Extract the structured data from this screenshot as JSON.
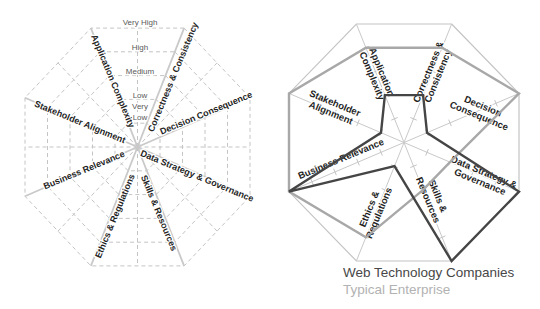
{
  "colors": {
    "series_dark": "#454545",
    "series_gray": "#a8a8a8",
    "grid_line": "#c4c4c4",
    "spoke_line": "#c9c9c9",
    "axis_label_color": "#1f1f1f",
    "scale_label_color": "#595959"
  },
  "legend": {
    "position": "bottom-right"
  },
  "chart_data": [
    {
      "type": "radar",
      "role": "scale-reference-octagon",
      "title": "",
      "axes": [
        "Application Complexity",
        "Correctness & Consistency",
        "Decision Consequence",
        "Data Strategy & Governance",
        "Skills & Resources",
        "Ethics & Regulations",
        "Business Relevance",
        "Stakeholder Alignment"
      ],
      "scale_labels": [
        "Very Low",
        "Low",
        "Medium",
        "High",
        "Very High"
      ],
      "levels": 5,
      "ylim": [
        0,
        5
      ],
      "grid": "dashed-octagon-rings",
      "series": []
    },
    {
      "type": "radar",
      "role": "comparison-octagon",
      "title": "",
      "axes": [
        [
          "Application",
          "Complexity"
        ],
        [
          "Correctness &",
          "Consistency"
        ],
        [
          "Decision",
          "Consequence"
        ],
        [
          "Data Strategy &",
          "Governance"
        ],
        [
          "Skills &",
          "Resources"
        ],
        [
          "Ethics &",
          "Regulations"
        ],
        [
          "Business Relevance"
        ],
        [
          "Stakeholder",
          "Alignment"
        ]
      ],
      "levels": 5,
      "ylim": [
        0,
        5
      ],
      "grid": "spokes-with-ticks",
      "legend_position": "bottom",
      "series": [
        {
          "name": "Typical Enterprise",
          "color": "#a8a8a8",
          "values": [
            4,
            4,
            5,
            2,
            2,
            4,
            5,
            5
          ]
        },
        {
          "name": "Web Technology Companies",
          "color": "#454545",
          "values": [
            2,
            2,
            1,
            5,
            5,
            1,
            5,
            1
          ]
        }
      ]
    }
  ]
}
